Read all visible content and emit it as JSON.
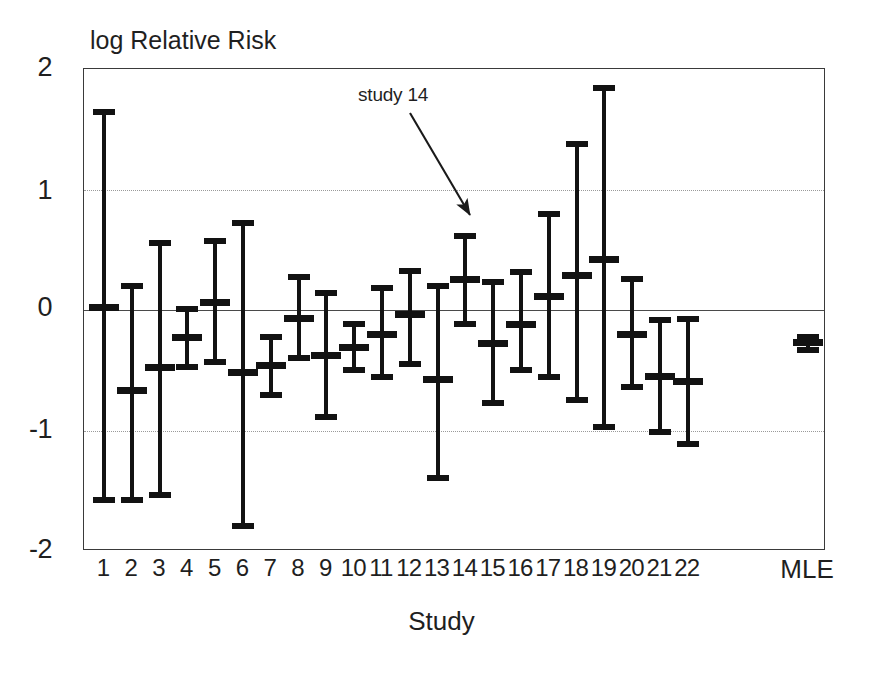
{
  "chart_data": {
    "type": "scatter",
    "title": "",
    "ylabel": "log Relative Risk",
    "xlabel": "Study",
    "ylim": [
      -2,
      2
    ],
    "yticks": [
      "2",
      "1",
      "0",
      "-1",
      "-2"
    ],
    "ytick_values": [
      2,
      1,
      0,
      -1,
      -2
    ],
    "gridlines": [
      1,
      -1
    ],
    "zero_reference_line": 0,
    "grid": "horizontal-dotted",
    "legend": "none",
    "categories": [
      "1",
      "2",
      "3",
      "4",
      "5",
      "6",
      "7",
      "8",
      "9",
      "10",
      "11",
      "12",
      "13",
      "14",
      "15",
      "16",
      "17",
      "18",
      "19",
      "20",
      "21",
      "22",
      "MLE"
    ],
    "series": [
      {
        "name": "log Relative Risk with 95% interval",
        "points": [
          {
            "label": "1",
            "estimate": 0.02,
            "lower": -1.6,
            "upper": 1.67
          },
          {
            "label": "2",
            "estimate": -0.67,
            "lower": -1.6,
            "upper": 0.22
          },
          {
            "label": "3",
            "estimate": -0.48,
            "lower": -1.56,
            "upper": 0.58
          },
          {
            "label": "4",
            "estimate": -0.23,
            "lower": -0.5,
            "upper": 0.03
          },
          {
            "label": "5",
            "estimate": 0.06,
            "lower": -0.46,
            "upper": 0.6
          },
          {
            "label": "6",
            "estimate": -0.52,
            "lower": -1.82,
            "upper": 0.75
          },
          {
            "label": "7",
            "estimate": -0.46,
            "lower": -0.73,
            "upper": -0.2
          },
          {
            "label": "8",
            "estimate": -0.07,
            "lower": -0.42,
            "upper": 0.3
          },
          {
            "label": "9",
            "estimate": -0.38,
            "lower": -0.91,
            "upper": 0.17
          },
          {
            "label": "10",
            "estimate": -0.31,
            "lower": -0.52,
            "upper": -0.09
          },
          {
            "label": "11",
            "estimate": -0.2,
            "lower": -0.58,
            "upper": 0.21
          },
          {
            "label": "12",
            "estimate": -0.04,
            "lower": -0.47,
            "upper": 0.35
          },
          {
            "label": "13",
            "estimate": -0.58,
            "lower": -1.42,
            "upper": 0.22
          },
          {
            "label": "14",
            "estimate": 0.25,
            "lower": -0.14,
            "upper": 0.64
          },
          {
            "label": "15",
            "estimate": -0.28,
            "lower": -0.8,
            "upper": 0.26
          },
          {
            "label": "16",
            "estimate": -0.12,
            "lower": -0.52,
            "upper": 0.34
          },
          {
            "label": "17",
            "estimate": 0.11,
            "lower": -0.58,
            "upper": 0.82
          },
          {
            "label": "18",
            "estimate": 0.29,
            "lower": -0.77,
            "upper": 1.4
          },
          {
            "label": "19",
            "estimate": 0.42,
            "lower": -1.0,
            "upper": 1.87
          },
          {
            "label": "20",
            "estimate": -0.2,
            "lower": -0.66,
            "upper": 0.28
          },
          {
            "label": "21",
            "estimate": -0.55,
            "lower": -1.04,
            "upper": -0.06
          },
          {
            "label": "22",
            "estimate": -0.59,
            "lower": -1.14,
            "upper": -0.05
          },
          {
            "label": "MLE",
            "estimate": -0.27,
            "lower": -0.36,
            "upper": -0.2
          }
        ]
      }
    ],
    "annotations": [
      {
        "text": "study 14",
        "target_label": "14",
        "arrow": "down-right"
      }
    ]
  },
  "axes": {
    "y_title": "log Relative Risk",
    "x_title": "Study",
    "y_ticks": [
      "2",
      "1",
      "0",
      "-1",
      "-2"
    ],
    "x_ticks": [
      "1",
      "2",
      "3",
      "4",
      "5",
      "6",
      "7",
      "8",
      "9",
      "10",
      "11",
      "12",
      "13",
      "14",
      "15",
      "16",
      "17",
      "18",
      "19",
      "20",
      "21",
      "22",
      "MLE"
    ]
  },
  "annotation": {
    "label": "study 14"
  },
  "colors": {
    "marker": "#121212",
    "frame": "#3a3a3a",
    "gridline": "#9a9a9a",
    "zero_line": "#4a4a4a",
    "text": "#1f1f1f",
    "background": "#ffffff"
  }
}
